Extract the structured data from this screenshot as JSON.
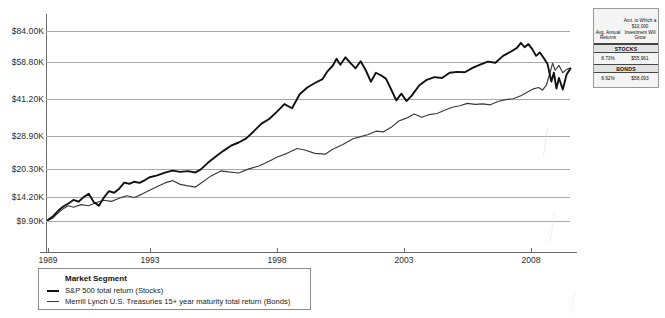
{
  "chart_data": {
    "type": "line",
    "title": "",
    "xlabel": "",
    "ylabel": "",
    "y_scale": "log",
    "grid": true,
    "legend_position": "bottom-left",
    "ylim": [
      9900,
      84000
    ],
    "xlim": [
      1989,
      2009.6
    ],
    "ytick_labels": [
      "$84.00K",
      "$58.80K",
      "$41.20K",
      "$28.90K",
      "$20.30K",
      "$14.20K",
      "$9.90K"
    ],
    "ytick_values": [
      84000,
      58800,
      41200,
      28900,
      20300,
      14200,
      9900
    ],
    "xtick_labels": [
      "1989",
      "1993",
      "1998",
      "2003",
      "2008"
    ],
    "xtick_values": [
      1989,
      1993,
      1998,
      2003,
      2008
    ],
    "legend_title": "Market Segment",
    "series": [
      {
        "name": "S&P 500 total return (Stocks)",
        "color": "#111111",
        "points": [
          [
            1989.0,
            10000
          ],
          [
            1989.2,
            10450
          ],
          [
            1989.4,
            11100
          ],
          [
            1989.6,
            11650
          ],
          [
            1989.8,
            12050
          ],
          [
            1990.0,
            12550
          ],
          [
            1990.2,
            12300
          ],
          [
            1990.4,
            12950
          ],
          [
            1990.6,
            13450
          ],
          [
            1990.8,
            12250
          ],
          [
            1991.0,
            11750
          ],
          [
            1991.2,
            12900
          ],
          [
            1991.4,
            13850
          ],
          [
            1991.6,
            13600
          ],
          [
            1991.8,
            14250
          ],
          [
            1992.0,
            15250
          ],
          [
            1992.2,
            15050
          ],
          [
            1992.4,
            15400
          ],
          [
            1992.6,
            15200
          ],
          [
            1992.8,
            15650
          ],
          [
            1993.0,
            16200
          ],
          [
            1993.3,
            16550
          ],
          [
            1993.6,
            17050
          ],
          [
            1993.9,
            17450
          ],
          [
            1994.2,
            17200
          ],
          [
            1994.5,
            17350
          ],
          [
            1994.8,
            17100
          ],
          [
            1995.0,
            17650
          ],
          [
            1995.3,
            19100
          ],
          [
            1995.6,
            20450
          ],
          [
            1995.9,
            21800
          ],
          [
            1996.2,
            23100
          ],
          [
            1996.5,
            23950
          ],
          [
            1996.8,
            25100
          ],
          [
            1997.1,
            27200
          ],
          [
            1997.4,
            29600
          ],
          [
            1997.7,
            31200
          ],
          [
            1998.0,
            33800
          ],
          [
            1998.3,
            36900
          ],
          [
            1998.6,
            35200
          ],
          [
            1998.9,
            41200
          ],
          [
            1999.2,
            44500
          ],
          [
            1999.5,
            46800
          ],
          [
            1999.8,
            48900
          ],
          [
            2000.0,
            53500
          ],
          [
            2000.2,
            56800
          ],
          [
            2000.35,
            61500
          ],
          [
            2000.5,
            57500
          ],
          [
            2000.7,
            62500
          ],
          [
            2000.9,
            58500
          ],
          [
            2001.1,
            55200
          ],
          [
            2001.3,
            59800
          ],
          [
            2001.5,
            54000
          ],
          [
            2001.7,
            47500
          ],
          [
            2001.9,
            52500
          ],
          [
            2002.1,
            51000
          ],
          [
            2002.3,
            49000
          ],
          [
            2002.5,
            43500
          ],
          [
            2002.7,
            38500
          ],
          [
            2002.9,
            41500
          ],
          [
            2003.1,
            38200
          ],
          [
            2003.3,
            40500
          ],
          [
            2003.6,
            45500
          ],
          [
            2003.9,
            48500
          ],
          [
            2004.2,
            50000
          ],
          [
            2004.5,
            49500
          ],
          [
            2004.8,
            52500
          ],
          [
            2005.1,
            53000
          ],
          [
            2005.4,
            52800
          ],
          [
            2005.7,
            55500
          ],
          [
            2006.0,
            57500
          ],
          [
            2006.3,
            59500
          ],
          [
            2006.6,
            58800
          ],
          [
            2006.9,
            63500
          ],
          [
            2007.2,
            66500
          ],
          [
            2007.45,
            69500
          ],
          [
            2007.6,
            73500
          ],
          [
            2007.75,
            70000
          ],
          [
            2007.9,
            72500
          ],
          [
            2008.05,
            68500
          ],
          [
            2008.2,
            63500
          ],
          [
            2008.35,
            66000
          ],
          [
            2008.5,
            62000
          ],
          [
            2008.65,
            58000
          ],
          [
            2008.8,
            47500
          ],
          [
            2008.9,
            52500
          ],
          [
            2009.0,
            44000
          ],
          [
            2009.1,
            49500
          ],
          [
            2009.25,
            43500
          ],
          [
            2009.4,
            51500
          ],
          [
            2009.55,
            55000
          ]
        ]
      },
      {
        "name": "Merrill Lynch U.S. Treasuries 15+ year maturity total return (Bonds)",
        "color": "#3b3b3b",
        "points": [
          [
            1989.0,
            10000
          ],
          [
            1989.2,
            10250
          ],
          [
            1989.4,
            10850
          ],
          [
            1989.6,
            11350
          ],
          [
            1989.8,
            11750
          ],
          [
            1990.0,
            11550
          ],
          [
            1990.3,
            11900
          ],
          [
            1990.6,
            11750
          ],
          [
            1990.9,
            12200
          ],
          [
            1991.2,
            12500
          ],
          [
            1991.5,
            12350
          ],
          [
            1991.8,
            12800
          ],
          [
            1992.1,
            13150
          ],
          [
            1992.4,
            12900
          ],
          [
            1992.7,
            13400
          ],
          [
            1993.0,
            14000
          ],
          [
            1993.3,
            14600
          ],
          [
            1993.6,
            15200
          ],
          [
            1993.9,
            15600
          ],
          [
            1994.2,
            14950
          ],
          [
            1994.5,
            14700
          ],
          [
            1994.8,
            14500
          ],
          [
            1995.0,
            15100
          ],
          [
            1995.4,
            16400
          ],
          [
            1995.8,
            17400
          ],
          [
            1996.1,
            17200
          ],
          [
            1996.5,
            17000
          ],
          [
            1996.9,
            17800
          ],
          [
            1997.3,
            18400
          ],
          [
            1997.7,
            19400
          ],
          [
            1998.0,
            20300
          ],
          [
            1998.4,
            21200
          ],
          [
            1998.8,
            22400
          ],
          [
            1999.1,
            22000
          ],
          [
            1999.5,
            21200
          ],
          [
            1999.9,
            21000
          ],
          [
            2000.2,
            22200
          ],
          [
            2000.6,
            23400
          ],
          [
            2001.0,
            25000
          ],
          [
            2001.3,
            25600
          ],
          [
            2001.6,
            26200
          ],
          [
            2001.9,
            27200
          ],
          [
            2002.2,
            27000
          ],
          [
            2002.5,
            28400
          ],
          [
            2002.8,
            30500
          ],
          [
            2003.1,
            31500
          ],
          [
            2003.4,
            33000
          ],
          [
            2003.7,
            31800
          ],
          [
            2004.0,
            32800
          ],
          [
            2004.3,
            33200
          ],
          [
            2004.6,
            34400
          ],
          [
            2004.9,
            35600
          ],
          [
            2005.2,
            36200
          ],
          [
            2005.5,
            37200
          ],
          [
            2005.8,
            36800
          ],
          [
            2006.1,
            37000
          ],
          [
            2006.4,
            36600
          ],
          [
            2006.7,
            38000
          ],
          [
            2007.0,
            38800
          ],
          [
            2007.3,
            39200
          ],
          [
            2007.6,
            40500
          ],
          [
            2007.9,
            42500
          ],
          [
            2008.1,
            43800
          ],
          [
            2008.3,
            44500
          ],
          [
            2008.45,
            43200
          ],
          [
            2008.6,
            45500
          ],
          [
            2008.75,
            52500
          ],
          [
            2008.85,
            58500
          ],
          [
            2008.95,
            54000
          ],
          [
            2009.1,
            57000
          ],
          [
            2009.25,
            52500
          ],
          [
            2009.4,
            54500
          ],
          [
            2009.55,
            55500
          ]
        ]
      }
    ]
  },
  "legend": {
    "title": "Market Segment",
    "items": [
      {
        "label": "S&P 500 total return (Stocks)"
      },
      {
        "label": "Merrill Lynch U.S. Treasuries 15+ year maturity total return (Bonds)"
      }
    ]
  },
  "summary_table": {
    "header_left": "Avg. Annual Returns",
    "header_right": "Amt. to Which a $10,000 Investment Will Grow",
    "header_right_lines": [
      "Amt. to Which",
      "a $10,000",
      "Investment",
      "Will Grow"
    ],
    "header_left_lines": [
      "Avg. Annual",
      "Returns"
    ],
    "rows": [
      {
        "band": "STOCKS",
        "avg_annual_return": "8.73%",
        "amount": "$55,961"
      },
      {
        "band": "BONDS",
        "avg_annual_return": "8.92%",
        "amount": "$58,093"
      }
    ]
  }
}
